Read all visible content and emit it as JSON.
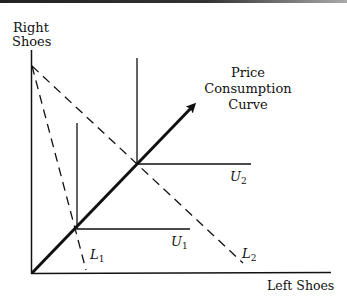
{
  "diagram": {
    "type": "economics-indifference-perfect-complements",
    "axes": {
      "y_label_line1": "Right",
      "y_label_line2": "Shoes",
      "x_label": "Left Shoes"
    },
    "curve_label": {
      "line1": "Price",
      "line2": "Consumption",
      "line3": "Curve"
    },
    "indifference_curves": [
      {
        "name": "U",
        "sub": "1"
      },
      {
        "name": "U",
        "sub": "2"
      }
    ],
    "budget_lines": [
      {
        "name": "L",
        "sub": "1"
      },
      {
        "name": "L",
        "sub": "2"
      }
    ],
    "colors": {
      "ink": "#111111",
      "background": "#ffffff"
    }
  }
}
